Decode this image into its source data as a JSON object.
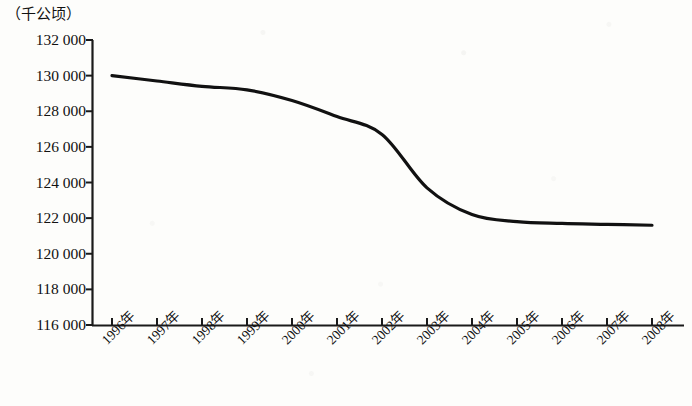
{
  "figure": {
    "unit_label": "（千公顷）",
    "line_color": "#111111",
    "axis_color": "#1a1a1a",
    "background_color": "#fdfdfb"
  },
  "chart_data": {
    "type": "line",
    "title": "",
    "subtitle": "",
    "xlabel": "",
    "ylabel": "（千公顷）",
    "unit": "千公顷",
    "grid": false,
    "legend": null,
    "legend_position": "none",
    "categories": [
      "1996年",
      "1997年",
      "1998年",
      "1999年",
      "2000年",
      "2001年",
      "2002年",
      "2003年",
      "2004年",
      "2005年",
      "2006年",
      "2007年",
      "2008年"
    ],
    "x": [
      1996,
      1997,
      1998,
      1999,
      2000,
      2001,
      2002,
      2003,
      2004,
      2005,
      2006,
      2007,
      2008
    ],
    "values": [
      130000,
      129700,
      129400,
      129200,
      128600,
      127700,
      126700,
      123700,
      122200,
      121800,
      121700,
      121650,
      121600
    ],
    "ylim": [
      116000,
      132000
    ],
    "ytick_values": [
      132000,
      130000,
      128000,
      126000,
      124000,
      122000,
      120000,
      118000,
      116000
    ],
    "ytick_labels": [
      "132 000",
      "130 000",
      "128 000",
      "126 000",
      "124 000",
      "122 000",
      "120 000",
      "118 000",
      "116 000"
    ],
    "xtick_labels": [
      "1996年",
      "1997年",
      "1998年",
      "1999年",
      "2000年",
      "2001年",
      "2002年",
      "2003年",
      "2004年",
      "2005年",
      "2006年",
      "2007年",
      "2008年"
    ],
    "xtick_rotation": -45,
    "annotations": []
  }
}
